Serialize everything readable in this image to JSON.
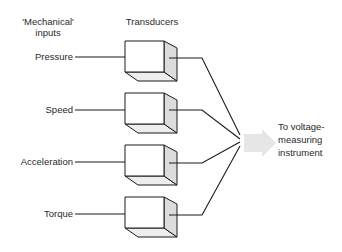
{
  "headers": {
    "inputs_line1": "'Mechanical'",
    "inputs_line2": "inputs",
    "transducers": "Transducers"
  },
  "inputs": [
    {
      "label": "Pressure"
    },
    {
      "label": "Speed"
    },
    {
      "label": "Acceleration"
    },
    {
      "label": "Torque"
    }
  ],
  "output": {
    "line1": "To voltage-",
    "line2": "measuring",
    "line3": "instrument"
  },
  "colors": {
    "line": "#1a1a1a",
    "box_front": "#ffffff",
    "box_side": "#dcdcdc",
    "box_bottom": "#eeeeee",
    "arrow": "#e6e6e6"
  }
}
